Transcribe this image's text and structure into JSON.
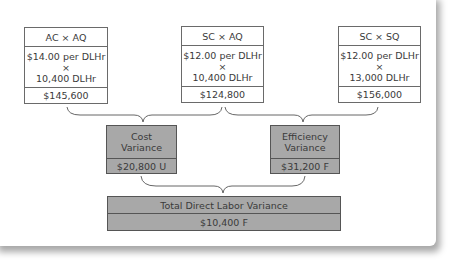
{
  "top_boxes": [
    {
      "header": "AC × AQ",
      "rate": "$14.00 per DLHr",
      "times": "×",
      "quantity": "10,400 DLHr",
      "total": "$145,600"
    },
    {
      "header": "SC × AQ",
      "rate": "$12.00 per DLHr",
      "times": "×",
      "quantity": "10,400 DLHr",
      "total": "$124,800"
    },
    {
      "header": "SC × SQ",
      "rate": "$12.00 per DLHr",
      "times": "×",
      "quantity": "13,000 DLHr",
      "total": "$156,000"
    }
  ],
  "variances": {
    "cost": {
      "label_line1": "Cost",
      "label_line2": "Variance",
      "value": "$20,800 U"
    },
    "efficiency": {
      "label_line1": "Efficiency",
      "label_line2": "Variance",
      "value": "$31,200 F"
    }
  },
  "total": {
    "label": "Total Direct Labor Variance",
    "value": "$10,400 F"
  },
  "colors": {
    "variance_fill": "#a8a8a8",
    "border": "#6a6a6a"
  }
}
